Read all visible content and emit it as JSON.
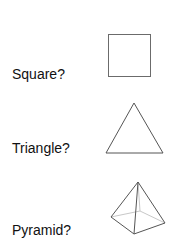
{
  "items": [
    {
      "label": "Square?",
      "shape": "square-icon"
    },
    {
      "label": "Triangle?",
      "shape": "triangle-icon"
    },
    {
      "label": "Pyramid?",
      "shape": "pyramid-icon"
    }
  ],
  "colors": {
    "stroke": "#6b6b6b",
    "hidden_edge": "#c8c8c8",
    "text": "#111111"
  }
}
